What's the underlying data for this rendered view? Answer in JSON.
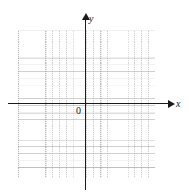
{
  "figure": {
    "kind": "cartesian-coordinate-plane",
    "title": "",
    "background_color": "#ffffff"
  },
  "axes": {
    "x_axis": {
      "label": "x",
      "color": "#1a1a1a",
      "arrow": "right"
    },
    "y_axis": {
      "label": "y",
      "color": "#1a1a1a",
      "arrow": "up"
    },
    "origin": {
      "label": "0"
    }
  },
  "grid": {
    "minor_color": "#aaaaaa",
    "major_color": "#969696",
    "minor_cells_x": 20,
    "minor_cells_y": 21,
    "minor_per_major": 4
  },
  "chart_data": {
    "type": "scatter",
    "title": "",
    "xlabel": "x",
    "ylabel": "y",
    "origin_label": "0",
    "grid": true,
    "legend": null,
    "series": [],
    "x": [],
    "y": [],
    "annotations": []
  }
}
